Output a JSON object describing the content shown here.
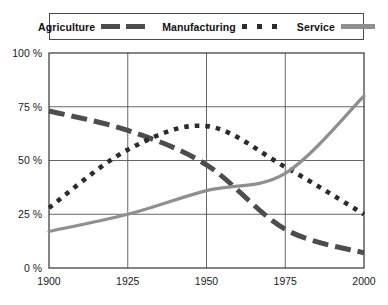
{
  "legend": {
    "entries": [
      {
        "label": "Agriculture",
        "style": "thick-dashed",
        "color": "#4d4d4d"
      },
      {
        "label": "Manufacturing",
        "style": "dotted",
        "color": "#2b2b2b"
      },
      {
        "label": "Service",
        "style": "solid",
        "color": "#8f8f8f"
      }
    ]
  },
  "axis": {
    "y_ticks": [
      "0 %",
      "25 %",
      "50 %",
      "75 %",
      "100 %"
    ],
    "x_ticks": [
      "1900",
      "1925",
      "1950",
      "1975",
      "2000"
    ]
  },
  "chart_data": {
    "type": "line",
    "title": "",
    "subtitle": "",
    "xlabel": "",
    "ylabel": "",
    "x": [
      1900,
      1925,
      1950,
      1975,
      2000
    ],
    "xlim": [
      1900,
      2000
    ],
    "ylim": [
      0,
      100
    ],
    "ytick_values": [
      0,
      25,
      50,
      75,
      100
    ],
    "ytick_labels": [
      "0 %",
      "25 %",
      "50 %",
      "75 %",
      "100 %"
    ],
    "xtick_values": [
      1900,
      1925,
      1950,
      1975,
      2000
    ],
    "xtick_labels": [
      "1900",
      "1925",
      "1950",
      "1975",
      "2000"
    ],
    "grid": true,
    "legend_position": "top",
    "series": [
      {
        "name": "Agriculture",
        "color": "#4d4d4d",
        "linestyle": "thick-dashed",
        "values": [
          73,
          64,
          48,
          18,
          7
        ]
      },
      {
        "name": "Manufacturing",
        "color": "#2b2b2b",
        "linestyle": "dotted",
        "values": [
          28,
          55,
          66,
          47,
          25
        ]
      },
      {
        "name": "Service",
        "color": "#8f8f8f",
        "linestyle": "solid",
        "values": [
          17,
          25,
          36,
          44,
          80
        ]
      }
    ]
  }
}
